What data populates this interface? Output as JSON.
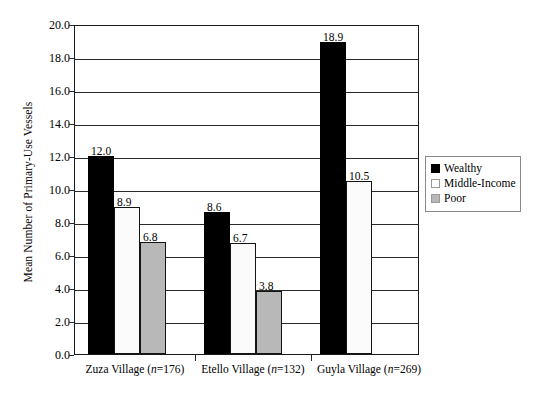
{
  "chart_data": {
    "type": "bar",
    "title": "",
    "xlabel": "",
    "ylabel": "Mean Number of Primary-Use Vessels",
    "ylim": [
      0,
      20
    ],
    "ytick_step": 2,
    "ytick_labels": [
      "0.0",
      "2.0",
      "4.0",
      "6.0",
      "8.0",
      "10.0",
      "12.0",
      "14.0",
      "16.0",
      "18.0",
      "20.0"
    ],
    "grid": true,
    "legend_position": "right-middle",
    "categories": [
      "Zuza Village (n=176)",
      "Etello Village (n=132)",
      "Guyla Village (n=269)"
    ],
    "category_parts": [
      {
        "name": "Zuza Village",
        "n_prefix": "(",
        "n_italic": "n",
        "n_value": "=176)"
      },
      {
        "name": "Etello Village",
        "n_prefix": "(",
        "n_italic": "n",
        "n_value": "=132)"
      },
      {
        "name": "Guyla Village",
        "n_prefix": "(",
        "n_italic": "n",
        "n_value": "=269)"
      }
    ],
    "series": [
      {
        "name": "Wealthy",
        "color": "#000000",
        "values": [
          12.0,
          8.6,
          18.9
        ],
        "labels": [
          "12.0",
          "8.6",
          "18.9"
        ]
      },
      {
        "name": "Middle-Income",
        "color": "#ffffff",
        "values": [
          8.9,
          6.7,
          10.5
        ],
        "labels": [
          "8.9",
          "6.7",
          "10.5"
        ]
      },
      {
        "name": "Poor",
        "color": "#b8b8b8",
        "values": [
          6.8,
          3.8,
          null
        ],
        "labels": [
          "6.8",
          "3.8",
          ""
        ]
      }
    ]
  },
  "legend": {
    "items": [
      {
        "label": "Wealthy",
        "swatch": "black-square-icon"
      },
      {
        "label": "Middle-Income",
        "swatch": "white-square-icon"
      },
      {
        "label": "Poor",
        "swatch": "gray-square-icon"
      }
    ]
  },
  "colors": {
    "wealthy": "#000000",
    "middle_income": "#ffffff",
    "poor": "#b8b8b8",
    "axis": "#1a1a1a",
    "background": "#ffffff"
  }
}
